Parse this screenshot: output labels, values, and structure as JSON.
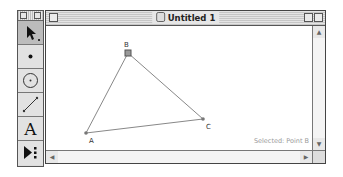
{
  "window": {
    "title": "Untitled 1"
  },
  "palette": {
    "tools": [
      {
        "name": "arrow-tool",
        "selected": true
      },
      {
        "name": "point-tool",
        "selected": false
      },
      {
        "name": "compass-tool",
        "selected": false
      },
      {
        "name": "straightedge-tool",
        "selected": false
      },
      {
        "name": "text-tool",
        "selected": false
      },
      {
        "name": "custom-tool",
        "selected": false
      }
    ],
    "text_tool_glyph": "A"
  },
  "sketch": {
    "points": [
      {
        "label": "A",
        "x": 40,
        "y": 107
      },
      {
        "label": "B",
        "x": 82,
        "y": 27
      },
      {
        "label": "C",
        "x": 157,
        "y": 93
      }
    ],
    "segments": [
      [
        "A",
        "B"
      ],
      [
        "B",
        "C"
      ],
      [
        "C",
        "A"
      ]
    ],
    "selected_point": "B"
  },
  "status": {
    "text": "Selected: Point B"
  },
  "scrollbars": {
    "up": "▲",
    "down": "▼",
    "left": "◀",
    "right": "▶"
  }
}
